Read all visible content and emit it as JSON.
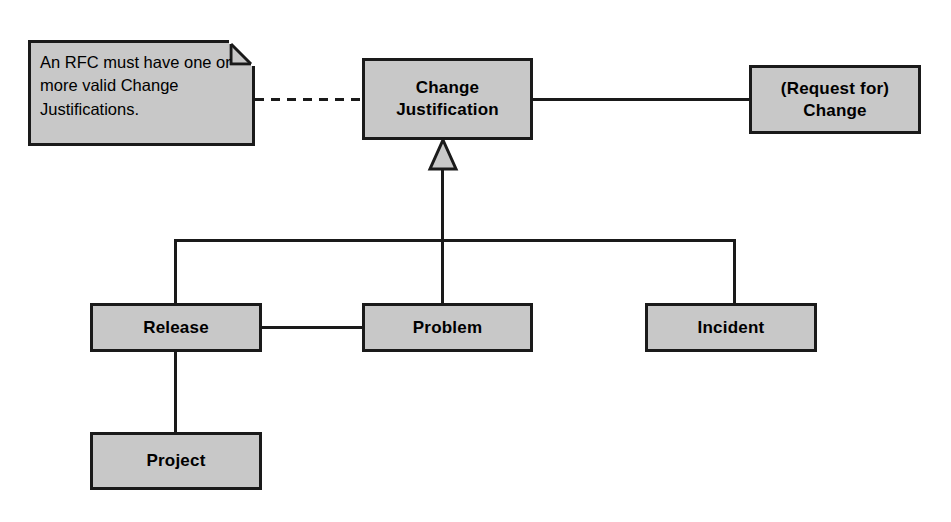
{
  "diagram": {
    "type": "uml-class-diagram",
    "background_color": "#ffffff",
    "node_fill_color": "#c8c8c8",
    "line_color": "#1a1a1a"
  },
  "note": {
    "text": "An RFC must have one or more valid Change Justifications.",
    "shape": "note-folded-corner"
  },
  "nodes": {
    "change_justification": {
      "label": "Change\nJustification"
    },
    "request_for_change": {
      "label": "(Request for)\nChange"
    },
    "release": {
      "label": "Release"
    },
    "problem": {
      "label": "Problem"
    },
    "incident": {
      "label": "Incident"
    },
    "project": {
      "label": "Project"
    }
  },
  "connectors": {
    "note_link": "dashed",
    "cj_to_rfc": "association",
    "generalization": "hollow-triangle",
    "release_to_problem": "association",
    "release_to_project": "association"
  }
}
